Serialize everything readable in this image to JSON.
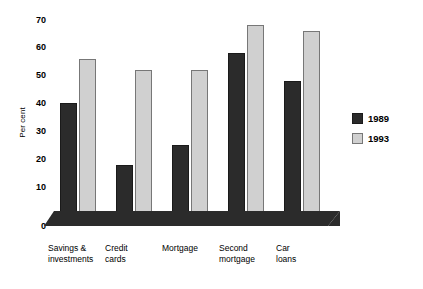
{
  "chart_data": {
    "type": "bar",
    "title": "",
    "xlabel": "",
    "ylabel": "Per cent",
    "ylim": [
      0,
      75
    ],
    "yticks": [
      0,
      10,
      20,
      30,
      40,
      50,
      60,
      70
    ],
    "grid": false,
    "legend_position": "right",
    "categories": [
      "Savings &\ninvestments",
      "Credit\ncards",
      "Mortgage",
      "Second\nmortgage",
      "Car\nloans"
    ],
    "series": [
      {
        "name": "1989",
        "color": "#2b2b2b",
        "values": [
          44,
          22,
          29,
          62,
          52
        ]
      },
      {
        "name": "1993",
        "color": "#d0d0d0",
        "values": [
          60,
          56,
          56,
          72,
          70
        ]
      }
    ]
  },
  "axis": {
    "y_label": "Per cent",
    "tick_70": "70",
    "tick_60": "60",
    "tick_50": "50",
    "tick_40": "40",
    "tick_30": "30",
    "tick_20": "20",
    "tick_10": "10",
    "tick_0": "0"
  },
  "categories": {
    "c0": "Savings &\ninvestments",
    "c1": "Credit\ncards",
    "c2": "Mortgage",
    "c3": "Second\nmortgage",
    "c4": "Car\nloans"
  },
  "legend": {
    "item0": "1989",
    "item1": "1993"
  }
}
